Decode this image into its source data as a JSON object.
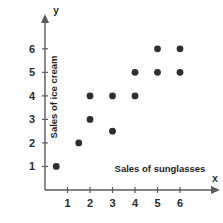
{
  "chart_data": {
    "type": "scatter",
    "title": "",
    "xlabel": "Sales of sunglasses",
    "ylabel": "Sales of ice cream",
    "x_axis_letter": "x",
    "y_axis_letter": "y",
    "xlim": [
      0,
      6.8
    ],
    "ylim": [
      0,
      6.8
    ],
    "xticks": [
      1,
      2,
      3,
      4,
      5,
      6
    ],
    "yticks": [
      1,
      2,
      3,
      4,
      5,
      6
    ],
    "xtick_labels": [
      "1",
      "2",
      "3",
      "4",
      "5",
      "6"
    ],
    "ytick_labels": [
      "1",
      "2",
      "3",
      "4",
      "5",
      "6"
    ],
    "grid": false,
    "legend": false,
    "point_color": "#2e2e2e",
    "axis_color": "#5a5a5a",
    "points": [
      {
        "x": 0.5,
        "y": 1
      },
      {
        "x": 1.5,
        "y": 2
      },
      {
        "x": 2,
        "y": 3
      },
      {
        "x": 2,
        "y": 4
      },
      {
        "x": 3,
        "y": 2.5
      },
      {
        "x": 3,
        "y": 4
      },
      {
        "x": 4,
        "y": 4
      },
      {
        "x": 4,
        "y": 5
      },
      {
        "x": 5,
        "y": 5
      },
      {
        "x": 5,
        "y": 6
      },
      {
        "x": 6,
        "y": 5
      },
      {
        "x": 6,
        "y": 6
      }
    ]
  }
}
